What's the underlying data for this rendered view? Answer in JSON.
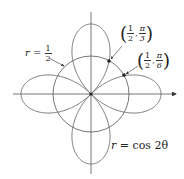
{
  "diagram": {
    "title": "",
    "curves": [
      {
        "id": "rose",
        "equation_label": "r = cos 2θ",
        "lhs": "r",
        "rhs": "cos 2θ"
      },
      {
        "id": "circle",
        "equation_label": "r = 1/2",
        "lhs": "r",
        "numerator": "1",
        "denominator": "2"
      }
    ],
    "points": [
      {
        "label": "(1/2, π/3)",
        "r_num": "1",
        "r_den": "2",
        "theta_num": "π",
        "theta_den": "3"
      },
      {
        "label": "(1/2, π/6)",
        "r_num": "1",
        "r_den": "2",
        "theta_num": "π",
        "theta_den": "6"
      }
    ],
    "colors": {
      "curve": "#666666",
      "axis": "#555555",
      "text": "#222222"
    }
  },
  "text": {
    "circle_eq_lhs": "r",
    "equals": "=",
    "circle_num": "1",
    "circle_den": "2",
    "rose_eq_lhs": "r",
    "rose_eq_rhs": "cos 2θ",
    "p1_open": "(",
    "p1_rnum": "1",
    "p1_rden": "2",
    "p1_comma": ",",
    "p1_tnum": "π",
    "p1_tden": "3",
    "p1_close": ")",
    "p2_open": "(",
    "p2_rnum": "1",
    "p2_rden": "2",
    "p2_comma": ",",
    "p2_tnum": "π",
    "p2_tden": "6",
    "p2_close": ")"
  }
}
